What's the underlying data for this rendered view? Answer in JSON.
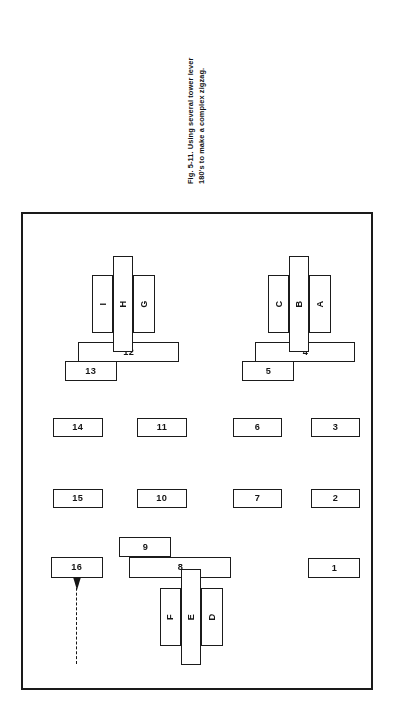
{
  "caption": {
    "line1": "Fig. 5-11. Using several tower lever",
    "line2": "180's to make a complex zigzag."
  },
  "figure": {
    "label": "Fig. 5-11",
    "orientation": "rotated-180",
    "border_color": "#1a1a1a",
    "fill_color": "#ffffff"
  },
  "diagram": {
    "numbered_blocks": [
      {
        "id": "block-1",
        "label": "1",
        "x": 11,
        "y": 110,
        "w": 52,
        "h": 20
      },
      {
        "id": "block-2",
        "label": "2",
        "x": 11,
        "y": 180,
        "w": 49,
        "h": 19
      },
      {
        "id": "block-3",
        "label": "3",
        "x": 11,
        "y": 251,
        "w": 49,
        "h": 19
      },
      {
        "id": "block-4",
        "label": "4",
        "x": 16,
        "y": 326,
        "w": 100,
        "h": 20
      },
      {
        "id": "block-5",
        "label": "5",
        "x": 77,
        "y": 307,
        "w": 52,
        "h": 20
      },
      {
        "id": "block-6",
        "label": "6",
        "x": 89,
        "y": 251,
        "w": 49,
        "h": 19
      },
      {
        "id": "block-7",
        "label": "7",
        "x": 89,
        "y": 180,
        "w": 49,
        "h": 19
      },
      {
        "id": "block-8",
        "label": "8",
        "x": 140,
        "y": 110,
        "w": 102,
        "h": 21
      },
      {
        "id": "block-9",
        "label": "9",
        "x": 200,
        "y": 131,
        "w": 52,
        "h": 20
      },
      {
        "id": "block-10",
        "label": "10",
        "x": 184,
        "y": 180,
        "w": 50,
        "h": 19
      },
      {
        "id": "block-11",
        "label": "11",
        "x": 184,
        "y": 251,
        "w": 50,
        "h": 19
      },
      {
        "id": "block-12",
        "label": "12",
        "x": 192,
        "y": 326,
        "w": 101,
        "h": 20
      },
      {
        "id": "block-13",
        "label": "13",
        "x": 254,
        "y": 307,
        "w": 52,
        "h": 20
      },
      {
        "id": "block-14",
        "label": "14",
        "x": 268,
        "y": 251,
        "w": 50,
        "h": 19
      },
      {
        "id": "block-15",
        "label": "15",
        "x": 268,
        "y": 180,
        "w": 50,
        "h": 19
      },
      {
        "id": "block-16",
        "label": "16",
        "x": 268,
        "y": 110,
        "w": 52,
        "h": 21
      }
    ],
    "lettered_blocks": [
      {
        "id": "block-A",
        "label": "A",
        "x": 40,
        "y": 355,
        "w": 22,
        "h": 58
      },
      {
        "id": "block-B",
        "label": "B",
        "x": 62,
        "y": 336,
        "w": 20,
        "h": 96
      },
      {
        "id": "block-C",
        "label": "C",
        "x": 82,
        "y": 355,
        "w": 21,
        "h": 58
      },
      {
        "id": "block-D",
        "label": "D",
        "x": 148,
        "y": 42,
        "w": 22,
        "h": 58
      },
      {
        "id": "block-E",
        "label": "E",
        "x": 170,
        "y": 23,
        "w": 20,
        "h": 96
      },
      {
        "id": "block-F",
        "label": "F",
        "x": 190,
        "y": 42,
        "w": 21,
        "h": 58
      },
      {
        "id": "block-G",
        "label": "G",
        "x": 216,
        "y": 355,
        "w": 22,
        "h": 58
      },
      {
        "id": "block-H",
        "label": "H",
        "x": 238,
        "y": 336,
        "w": 20,
        "h": 96
      },
      {
        "id": "block-I",
        "label": "I",
        "x": 258,
        "y": 355,
        "w": 21,
        "h": 58
      }
    ],
    "arrow": {
      "id": "motion-arrow",
      "direction": "down-in-figure-space",
      "x": 288,
      "y": 24,
      "w": 12,
      "h": 86
    }
  }
}
